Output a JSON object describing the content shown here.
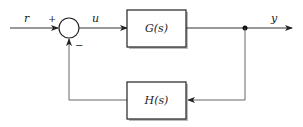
{
  "diagram": {
    "type": "feedback control block diagram",
    "signals": {
      "reference": "r",
      "control": "u",
      "output": "y"
    },
    "summing_junction": {
      "plus_sign": "+",
      "minus_sign": "−"
    },
    "blocks": {
      "forward": "G(s)",
      "feedback": "H(s)"
    },
    "colors": {
      "line": "#333333",
      "block_border": "#222222",
      "background": "#ffffff"
    }
  }
}
